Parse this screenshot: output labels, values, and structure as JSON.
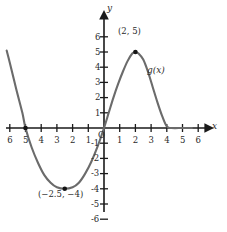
{
  "figure": {
    "axis_x_letter": "x",
    "axis_y_letter": "y",
    "origin_label": "O"
  },
  "chart_data": {
    "type": "line",
    "title": "",
    "xlabel": "x",
    "ylabel": "y",
    "xlim": [
      -6.6,
      6.6
    ],
    "ylim": [
      -6.6,
      6.6
    ],
    "grid": false,
    "legend": "none",
    "x_tick_labels": [
      "6",
      "5",
      "4",
      "3",
      "2",
      "1",
      "1",
      "2",
      "3",
      "4",
      "5",
      "6"
    ],
    "x_tick_values": [
      -6,
      -5,
      -4,
      -3,
      -2,
      -1,
      1,
      2,
      3,
      4,
      5,
      6
    ],
    "y_tick_labels": [
      "6",
      "5",
      "4",
      "3",
      "2",
      "1",
      "-1",
      "-2",
      "-3",
      "-4",
      "-5",
      "-6"
    ],
    "y_tick_values": [
      6,
      5,
      4,
      3,
      2,
      1,
      -1,
      -2,
      -3,
      -4,
      -5,
      -6
    ],
    "series": [
      {
        "name": "g(x)",
        "color": "#6b6b6b",
        "points": [
          [
            -6.2,
            5.1
          ],
          [
            -6.0,
            4.3
          ],
          [
            -5.6,
            2.6
          ],
          [
            -5.2,
            1.0
          ],
          [
            -5.0,
            0.0
          ],
          [
            -4.6,
            -1.3
          ],
          [
            -4.2,
            -2.3
          ],
          [
            -3.8,
            -3.1
          ],
          [
            -3.4,
            -3.6
          ],
          [
            -3.0,
            -3.9
          ],
          [
            -2.5,
            -4.0
          ],
          [
            -2.0,
            -3.9
          ],
          [
            -1.6,
            -3.6
          ],
          [
            -1.2,
            -3.0
          ],
          [
            -0.8,
            -2.2
          ],
          [
            -0.4,
            -1.2
          ],
          [
            0.0,
            0.0
          ],
          [
            0.3,
            1.0
          ],
          [
            0.6,
            2.0
          ],
          [
            0.9,
            2.9
          ],
          [
            1.2,
            3.7
          ],
          [
            1.5,
            4.4
          ],
          [
            1.8,
            4.9
          ],
          [
            2.0,
            5.0
          ],
          [
            2.2,
            4.9
          ],
          [
            2.5,
            4.5
          ],
          [
            2.8,
            3.7
          ],
          [
            3.1,
            2.7
          ],
          [
            3.4,
            1.7
          ],
          [
            3.7,
            0.8
          ],
          [
            4.0,
            0.1
          ],
          [
            4.3,
            0.0
          ],
          [
            5.0,
            0.0
          ],
          [
            5.6,
            0.0
          ]
        ]
      }
    ],
    "marked_points": [
      {
        "name": "maximum",
        "label": "(2, 5)",
        "x": 2,
        "y": 5
      },
      {
        "name": "minimum",
        "label": "(−2.5, −4)",
        "x": -2.5,
        "y": -4
      },
      {
        "name": "x-intercept",
        "label": "",
        "x": -5,
        "y": 0
      }
    ],
    "curve_label": "g(x)",
    "annotations": [
      {
        "text": "(2, 5)",
        "x": 2,
        "y": 5.9
      },
      {
        "text": "(−2.5, −4)",
        "x": -2.9,
        "y": -4.9
      },
      {
        "text": "g(x)",
        "x": 3.2,
        "y": 3.4
      }
    ]
  }
}
